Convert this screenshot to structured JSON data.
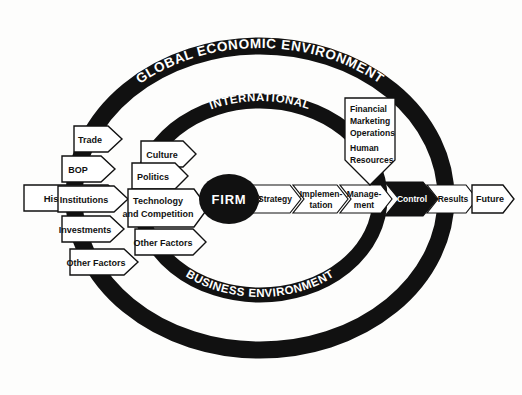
{
  "diagram": {
    "colors": {
      "ink": "#111111",
      "paper": "#ffffff",
      "ring": "#111111"
    },
    "rings": [
      {
        "id": "outer",
        "top_label": "GLOBAL ECONOMIC ENVIRONMENT",
        "bottom_label": ""
      },
      {
        "id": "inner",
        "top_label": "INTERNATIONAL",
        "bottom_label": "BUSINESS ENVIRONMENT"
      }
    ],
    "core": {
      "label": "FIRM"
    },
    "outer_inputs": [
      {
        "label": "Trade"
      },
      {
        "label": "BOP"
      },
      {
        "label": "Institutions"
      },
      {
        "label": "Investments"
      },
      {
        "label": "Other Factors"
      }
    ],
    "far_left_input": {
      "label": "History"
    },
    "inner_inputs": [
      {
        "label": "Culture"
      },
      {
        "label": "Politics"
      },
      {
        "label": "Technology",
        "label2": "and Competition"
      },
      {
        "label": "Other Factors"
      }
    ],
    "process_chain": [
      {
        "label": "Strategy",
        "style": "outline"
      },
      {
        "label": "Implemen-",
        "label2": "tation",
        "style": "outline"
      },
      {
        "label": "Manage-",
        "label2": "ment",
        "style": "outline"
      },
      {
        "label": "Control",
        "style": "filled"
      },
      {
        "label": "Results",
        "style": "outline"
      }
    ],
    "final_output": {
      "label": "Future"
    },
    "functions_box": {
      "lines": [
        "Financial",
        "Marketing",
        "Operations",
        "Human",
        "Resources"
      ],
      "target": "Manage-ment"
    }
  }
}
